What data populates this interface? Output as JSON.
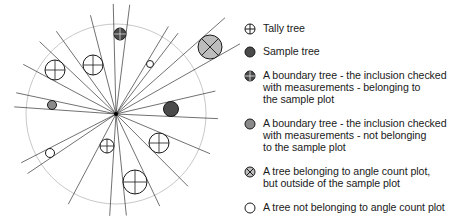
{
  "diagram": {
    "type": "angle-count sample plot illustration",
    "plot_circle": {
      "cx": 116,
      "cy": 114,
      "r": 90
    },
    "center": {
      "cx": 116,
      "cy": 114
    },
    "trees": [
      {
        "kind": "boundary_in",
        "cx": 120,
        "cy": 34,
        "r": 6
      },
      {
        "kind": "angle_outside",
        "cx": 210,
        "cy": 47,
        "r": 12
      },
      {
        "kind": "not_belonging",
        "cx": 150,
        "cy": 64,
        "r": 3.5
      },
      {
        "kind": "tally",
        "cx": 55,
        "cy": 70,
        "r": 10
      },
      {
        "kind": "tally",
        "cx": 93,
        "cy": 65,
        "r": 10
      },
      {
        "kind": "boundary_out",
        "cx": 52,
        "cy": 105,
        "r": 4.5
      },
      {
        "kind": "sample",
        "cx": 171,
        "cy": 109,
        "r": 7.5
      },
      {
        "kind": "tally",
        "cx": 107,
        "cy": 146,
        "r": 7
      },
      {
        "kind": "tally",
        "cx": 159,
        "cy": 143,
        "r": 10
      },
      {
        "kind": "not_belonging",
        "cx": 50,
        "cy": 153,
        "r": 4.5
      },
      {
        "kind": "tally",
        "cx": 135,
        "cy": 182,
        "r": 12
      }
    ],
    "colors": {
      "plot_circle": "#c8c8c8",
      "ray": "#333333",
      "dark_fill": "#4a4a4a",
      "gray_fill": "#8a8a8a",
      "light_fill": "#bdbdbd",
      "outline": "#1a1a1a"
    }
  },
  "legend": {
    "items": [
      {
        "icon": "tally-tree-icon",
        "label": "Tally tree"
      },
      {
        "icon": "sample-tree-icon",
        "label": "Sample tree"
      },
      {
        "icon": "boundary-tree-in-icon",
        "label": "A boundary tree - the inclusion checked\nwith measurements - belonging to\nthe sample plot"
      },
      {
        "icon": "boundary-tree-out-icon",
        "label": "A boundary tree - the inclusion checked\nwith measurements - not belonging\nto the sample plot"
      },
      {
        "icon": "angle-count-outside-icon",
        "label": "A tree belonging to angle count plot,\nbut outside of the sample plot"
      },
      {
        "icon": "not-belonging-icon",
        "label": "A tree not belonging to angle count plot"
      }
    ]
  }
}
